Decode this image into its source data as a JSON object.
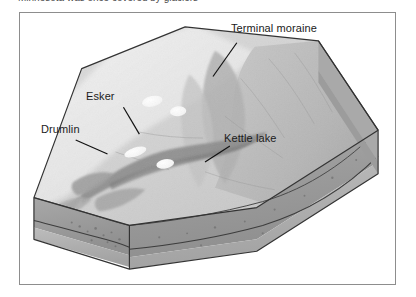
{
  "page": {
    "background_color": "#ffffff",
    "clipped_header_text": "Minnesota was once covered by glaciers"
  },
  "figure": {
    "frame_color": "#8d8d8d",
    "type": "block-diagram",
    "labels": [
      {
        "id": "terminal-moraine",
        "text": "Terminal moraine",
        "leader": true
      },
      {
        "id": "esker",
        "text": "Esker",
        "leader": true
      },
      {
        "id": "drumlin",
        "text": "Drumlin",
        "leader": true
      },
      {
        "id": "kettle-lake",
        "text": "Kettle lake",
        "leader": true
      }
    ],
    "colors": {
      "ice_sheet": "#eeeeee",
      "outwash_plain": "#d7d7d7",
      "upland_surface": "#bdbdbd",
      "moraine_ridge": "#a3a3a3",
      "esker_ridge": "#8f8f8f",
      "kettle_lake": "#fbfbfb",
      "cross_section_till": "#9b9b9b",
      "cross_section_bedrock": "#b0b0b0",
      "outline": "#3a3a3a"
    }
  }
}
